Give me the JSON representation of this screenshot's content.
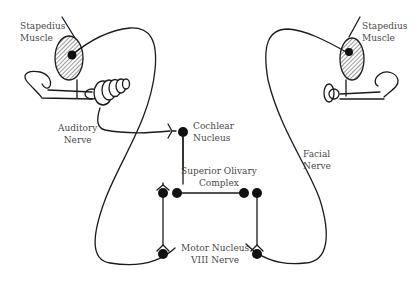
{
  "diagram": {
    "labels": {
      "stapedius_left": [
        "Stapedius",
        "Muscle"
      ],
      "stapedius_right": [
        "Stapedius",
        "Muscle"
      ],
      "auditory_nerve": [
        "Auditory",
        "Nerve"
      ],
      "cochlear_nucleus": [
        "Cochlear",
        "Nucleus"
      ],
      "superior_olivary": [
        "Superior Olivary",
        "Complex"
      ],
      "facial_nerve": [
        "Facial",
        "Nerve"
      ],
      "motor_nucleus": [
        "Motor Nucleus",
        "VIII Nerve"
      ]
    },
    "colors": {
      "stroke": "#1a1a1a",
      "text": "#4a4a4a",
      "hatch": "#555555",
      "background": "#ffffff"
    }
  }
}
